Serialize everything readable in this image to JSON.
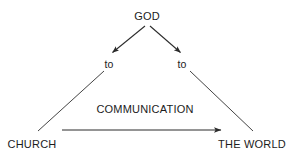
{
  "diagram": {
    "background_color": "#ffffff",
    "stroke_color": "#2b2b2b",
    "text_color": "#1c1c1c",
    "nodes": {
      "god": "GOD",
      "to_left": "to",
      "to_right": "to",
      "church": "CHURCH",
      "world": "THE WORLD",
      "communication": "COMMUNICATION"
    },
    "edges": [
      {
        "name": "god-to-left-arrow",
        "from": "GOD",
        "to": "to",
        "arrowhead": true,
        "x1": 145,
        "y1": 26,
        "x2": 112,
        "y2": 53
      },
      {
        "name": "god-to-right-arrow",
        "from": "GOD",
        "to": "to",
        "arrowhead": true,
        "x1": 150,
        "y1": 26,
        "x2": 180,
        "y2": 53
      },
      {
        "name": "left-side-line",
        "from": "to",
        "to": "CHURCH",
        "arrowhead": false,
        "x1": 104,
        "y1": 71,
        "x2": 38,
        "y2": 131
      },
      {
        "name": "right-side-line",
        "from": "to",
        "to": "THE WORLD",
        "arrowhead": false,
        "x1": 190,
        "y1": 71,
        "x2": 253,
        "y2": 131
      },
      {
        "name": "communication-arrow",
        "from": "CHURCH",
        "to": "THE WORLD",
        "arrowhead": true,
        "x1": 62,
        "y1": 130,
        "x2": 222,
        "y2": 130
      }
    ]
  }
}
